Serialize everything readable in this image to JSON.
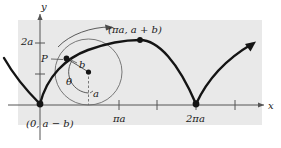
{
  "figure": {
    "kind": "curtate-cycloid-diagram",
    "background_color": "#ffffff",
    "panel_color": "#e9e9e9",
    "ink_color": "#1a1a1a",
    "axis_color": "#555555",
    "circle_color": "#6b6b6b"
  },
  "axes": {
    "y_label": "y",
    "x_label": "x",
    "y_tick_label": "2a",
    "x_tick_labels": [
      "πa",
      "2πa"
    ]
  },
  "labels": {
    "point_p": "P",
    "radius_b": "b",
    "radius_a": "a",
    "angle_theta": "θ",
    "top_point": "(πa, a + b)",
    "origin_point": "(0, a − b)"
  },
  "annotations": {
    "rotation_arrow": "rotation-direction-arrow",
    "curve": "cycloid-curve",
    "rolling_circle": "rolling-circle"
  }
}
